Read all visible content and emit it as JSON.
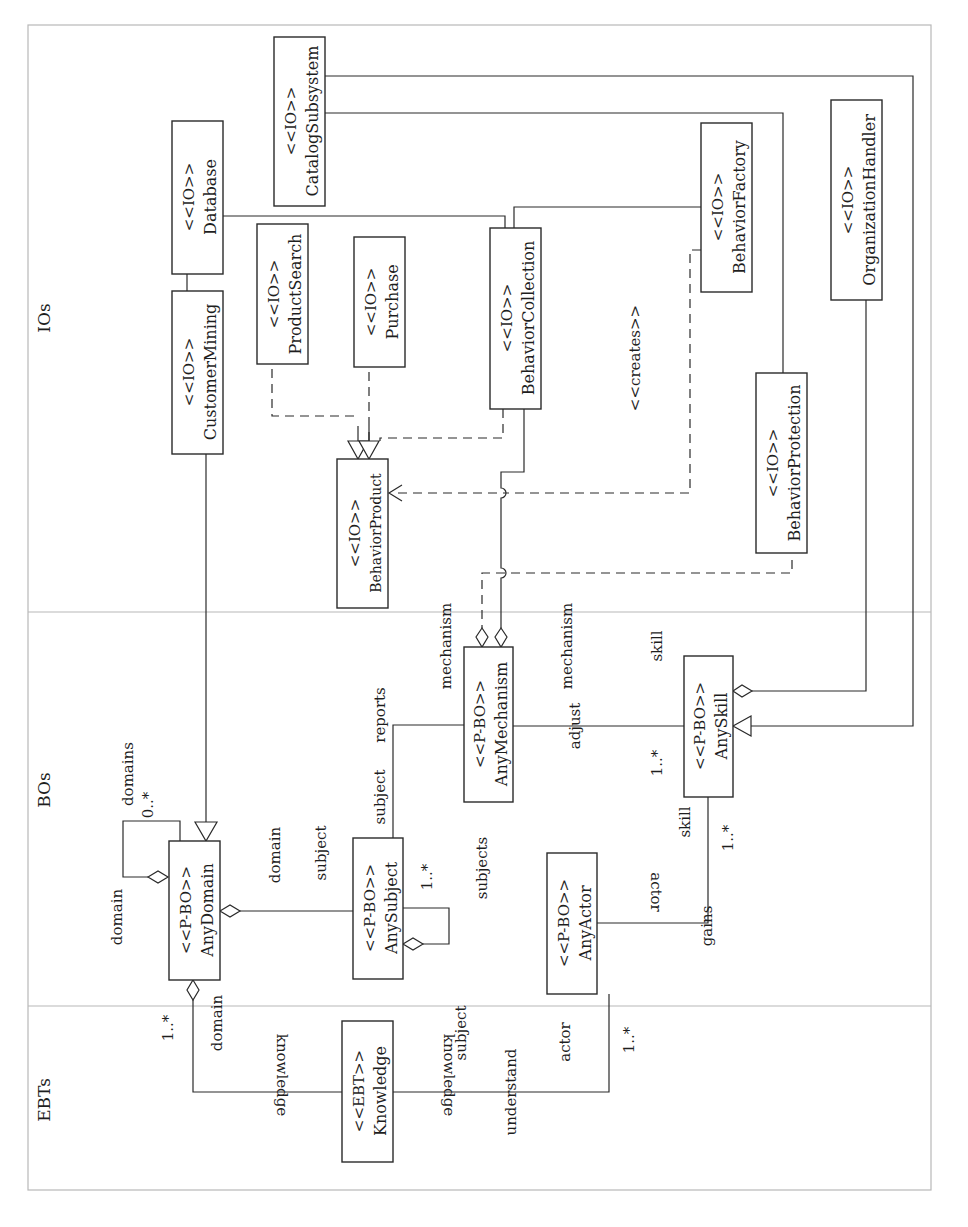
{
  "diagram": {
    "type": "UML class diagram (rotated 90° counter-clockwise)",
    "lanes": [
      {
        "id": "ios",
        "label": "IOs"
      },
      {
        "id": "bos",
        "label": "BOs"
      },
      {
        "id": "ebts",
        "label": "EBTs"
      }
    ],
    "classes": {
      "catalog_subsystem": {
        "stereotype": "<<IO>>",
        "name": "CatalogSubsystem"
      },
      "database": {
        "stereotype": "<<IO>>",
        "name": "Database"
      },
      "customer_mining": {
        "stereotype": "<<IO>>",
        "name": "CustomerMining"
      },
      "product_search": {
        "stereotype": "<<IO>>",
        "name": "ProductSearch"
      },
      "purchase": {
        "stereotype": "<<IO>>",
        "name": "Purchase"
      },
      "behavior_collection": {
        "stereotype": "<<IO>>",
        "name": "BehaviorCollection"
      },
      "behavior_factory": {
        "stereotype": "<<IO>>",
        "name": "BehaviorFactory"
      },
      "organization_handler": {
        "stereotype": "<<IO>>",
        "name": "OrganizationHandler"
      },
      "behavior_protection": {
        "stereotype": "<<IO>>",
        "name": "BehaviorProtection"
      },
      "behavior_product": {
        "stereotype": "<<IO>>",
        "name": "BehaviorProduct"
      },
      "any_domain": {
        "stereotype": "<<P-BO>>",
        "name": "AnyDomain"
      },
      "any_subject": {
        "stereotype": "<<P-BO>>",
        "name": "AnySubject"
      },
      "any_mechanism": {
        "stereotype": "<<P-BO>>",
        "name": "AnyMechanism"
      },
      "any_skill": {
        "stereotype": "<<P-BO>>",
        "name": "AnySkill"
      },
      "any_actor": {
        "stereotype": "<<P-BO>>",
        "name": "AnyActor"
      },
      "knowledge": {
        "stereotype": "<<EBT>>",
        "name": "Knowledge"
      }
    },
    "labels": {
      "creates": "<<creates>>",
      "domains": "domains",
      "domains_mult": "0..*",
      "domain_self": "domain",
      "domain_assoc": "domain",
      "subject_assoc": "subject",
      "subject_reports": "subject",
      "reports": "reports",
      "mechanism_left": "mechanism",
      "mechanism_right": "mechanism",
      "skill_top": "skill",
      "adjust": "adjust",
      "skill_mult": "1..*",
      "subject_self_mult": "1..*",
      "subjects": "subjects",
      "skill_gains": "skill",
      "skill_gains_mult": "1..*",
      "actor_gains": "actor",
      "gains": "gains",
      "domain_knowledge_mult": "1..*",
      "domain_knowledge": "domain",
      "knowledge_left": "knowledge",
      "knowledge_right": "knowledge",
      "subject_understand": "subject",
      "understand": "understand",
      "actor_understand": "actor",
      "actor_mult": "1..*"
    }
  }
}
